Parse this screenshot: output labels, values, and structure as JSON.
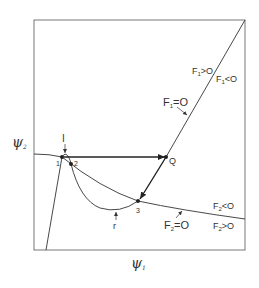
{
  "figure": {
    "x_axis_label": "ψ",
    "x_axis_sub": "1",
    "y_axis_label": "ψ",
    "y_axis_sub": "2",
    "curves": {
      "F1": {
        "name": "F",
        "sub": "1",
        "zero_label": "=O",
        "pos_label": ">O",
        "neg_label": "<O"
      },
      "F2": {
        "name": "F",
        "sub": "2",
        "zero_label": "=O",
        "pos_label": ">O",
        "neg_label": "<O"
      }
    },
    "points": {
      "p1": "1",
      "p2": "2",
      "p3": "3",
      "Q": "Q"
    },
    "annotations": {
      "I": "I",
      "r": "r"
    }
  }
}
